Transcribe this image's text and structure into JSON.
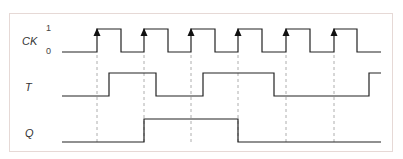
{
  "diagram": {
    "signals": [
      {
        "name": "CK",
        "levels": [
          "1",
          "0"
        ]
      },
      {
        "name": "T"
      },
      {
        "name": "Q"
      }
    ],
    "clock_rising_edges_x": [
      97,
      144,
      191,
      238,
      286,
      334
    ],
    "clock_falling_edges_x": [
      121,
      168,
      215,
      262,
      310,
      357
    ],
    "T_transitions_x": [
      109,
      156,
      203,
      274,
      369
    ],
    "Q_transitions_x": [
      144,
      238
    ],
    "colors": {
      "line": "#222222",
      "dash": "#999999",
      "frame": "#e6d9d6"
    }
  }
}
